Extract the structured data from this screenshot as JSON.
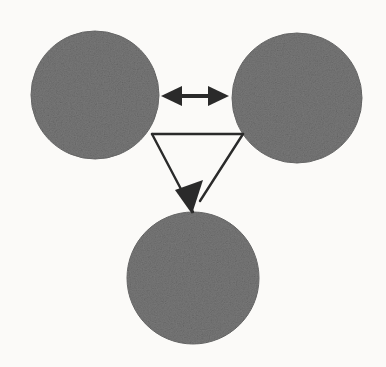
{
  "figure": {
    "medium": "scanned photocopy",
    "canvas": {
      "width": 386,
      "height": 367
    },
    "background_color": "#fbfaf8",
    "ink_color": "#2b2b2b",
    "node_fill_color": "#787878",
    "node_edge_color": "#6d6d6d",
    "nodes": [
      {
        "id": "node-left",
        "label": "",
        "shape": "circle",
        "cx": 95,
        "cy": 95,
        "r": 64,
        "fill": "#787878"
      },
      {
        "id": "node-right",
        "label": "",
        "shape": "circle",
        "cx": 297,
        "cy": 98,
        "r": 65,
        "fill": "#787878"
      },
      {
        "id": "node-bottom",
        "label": "",
        "shape": "circle",
        "cx": 193,
        "cy": 278,
        "r": 66,
        "fill": "#787878"
      }
    ],
    "connectors": [
      {
        "id": "connector-horizontal",
        "label": "",
        "type": "double-headed-arrow",
        "from": "node-left",
        "to": "node-right",
        "x1": 163,
        "y1": 96,
        "x2": 227,
        "y2": 96,
        "stroke_width": 3,
        "arrowheads": "both"
      },
      {
        "id": "connector-top-edge",
        "label": "",
        "type": "line",
        "from": "node-left",
        "to": "node-right",
        "x1": 152,
        "y1": 134,
        "x2": 243,
        "y2": 134,
        "stroke_width": 2,
        "arrowheads": "none"
      },
      {
        "id": "connector-left-leg",
        "label": "",
        "type": "line",
        "from": "node-left",
        "to": "node-bottom",
        "x1": 152,
        "y1": 134,
        "x2": 193,
        "y2": 212,
        "stroke_width": 2,
        "arrowheads": "none"
      },
      {
        "id": "connector-right-leg",
        "label": "",
        "type": "arrow",
        "from": "node-right",
        "to": "node-bottom",
        "x1": 243,
        "y1": 134,
        "x2": 193,
        "y2": 212,
        "stroke_width": 2,
        "arrowheads": "end"
      }
    ],
    "ghost_text": [
      {
        "id": "ghost-1",
        "text": "in the why  are  for   integra",
        "x": 26,
        "y": 14,
        "size": 15
      },
      {
        "id": "ghost-2",
        "text": "order  the  paon is",
        "x": 240,
        "y": 8,
        "size": 14
      },
      {
        "id": "ghost-3",
        "text": "and  orbit  according to",
        "x": 8,
        "y": 166,
        "size": 14
      },
      {
        "id": "ghost-4",
        "text": "a number in A  with the",
        "x": 6,
        "y": 192,
        "size": 14
      },
      {
        "id": "ghost-5",
        "text": "to  the  sin",
        "x": 268,
        "y": 170,
        "size": 13
      },
      {
        "id": "ghost-6",
        "text": "as  the",
        "x": 276,
        "y": 196,
        "size": 13
      },
      {
        "id": "ghost-7",
        "text": "and  the",
        "x": 18,
        "y": 318,
        "size": 13
      },
      {
        "id": "ghost-8",
        "text": "are",
        "x": 96,
        "y": 330,
        "size": 13
      }
    ]
  }
}
